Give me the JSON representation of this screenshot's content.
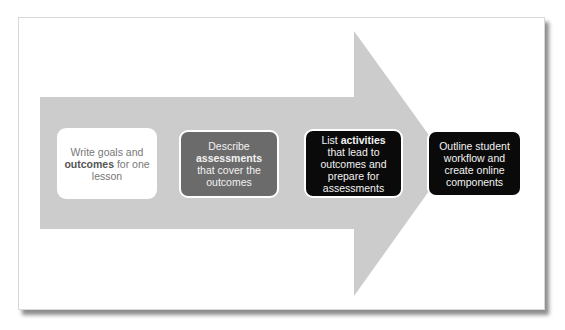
{
  "diagram": {
    "type": "process-arrow",
    "arrow_color": "#cccccc",
    "steps": [
      {
        "id": 1,
        "pre": "Write goals and ",
        "bold": "outcomes",
        "post": " for one lesson",
        "fill": "#ffffff",
        "text_color": "#777777"
      },
      {
        "id": 2,
        "pre": "Describe ",
        "bold": "assessments",
        "post": " that cover the outcomes",
        "fill": "#6b6b6b",
        "text_color": "#f2f2f2"
      },
      {
        "id": 3,
        "pre": "List ",
        "bold": "activities",
        "post": " that lead to outcomes and prepare for assessments",
        "fill": "#0a0a0a",
        "text_color": "#f2f2f2"
      },
      {
        "id": 4,
        "pre": "Outline student workflow and create online components",
        "bold": "",
        "post": "",
        "fill": "#0a0a0a",
        "text_color": "#f2f2f2"
      }
    ]
  }
}
